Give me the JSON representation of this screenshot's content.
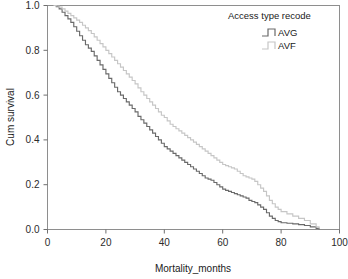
{
  "chart_data": {
    "type": "line",
    "title": "",
    "xlabel": "Mortality_months",
    "ylabel": "Cum survival",
    "xlim": [
      0,
      100
    ],
    "ylim": [
      0.0,
      1.0
    ],
    "grid": false,
    "legend_position": "top-right",
    "legend_title": "Access type recode",
    "xticks": [
      0,
      20,
      40,
      60,
      80,
      100
    ],
    "xticklabels": [
      "0",
      "20",
      "40",
      "60",
      "80",
      "100"
    ],
    "yticks": [
      0.0,
      0.2,
      0.4,
      0.6,
      0.8,
      1.0
    ],
    "yticklabels": [
      "0.0",
      "0.2",
      "0.4",
      "0.6",
      "0.8",
      "1.0"
    ],
    "series": [
      {
        "name": "AVG",
        "color": "#6a6a6a",
        "x": [
          2,
          3,
          4,
          5,
          6,
          7,
          8,
          9,
          10,
          11,
          12,
          13,
          14,
          15,
          16,
          17,
          18,
          19,
          20,
          21,
          22,
          23,
          24,
          25,
          26,
          27,
          28,
          29,
          30,
          31,
          32,
          33,
          34,
          35,
          36,
          37,
          38,
          39,
          40,
          41,
          42,
          43,
          44,
          45,
          46,
          47,
          48,
          49,
          50,
          51,
          52,
          53,
          54,
          55,
          56,
          57,
          58,
          59,
          60,
          61,
          62,
          63,
          64,
          65,
          66,
          67,
          68,
          69,
          70,
          71,
          72,
          73,
          74,
          75,
          76,
          77,
          78,
          79,
          80,
          82,
          84,
          86,
          88,
          90,
          92,
          93
        ],
        "values": [
          1.0,
          0.995,
          0.985,
          0.97,
          0.955,
          0.94,
          0.925,
          0.905,
          0.885,
          0.865,
          0.845,
          0.825,
          0.81,
          0.795,
          0.775,
          0.755,
          0.735,
          0.715,
          0.695,
          0.675,
          0.655,
          0.635,
          0.615,
          0.6,
          0.585,
          0.57,
          0.555,
          0.54,
          0.525,
          0.505,
          0.49,
          0.475,
          0.46,
          0.445,
          0.43,
          0.415,
          0.4,
          0.385,
          0.37,
          0.36,
          0.35,
          0.34,
          0.33,
          0.32,
          0.31,
          0.3,
          0.29,
          0.28,
          0.27,
          0.26,
          0.25,
          0.24,
          0.23,
          0.225,
          0.22,
          0.21,
          0.2,
          0.19,
          0.18,
          0.175,
          0.17,
          0.165,
          0.16,
          0.155,
          0.15,
          0.145,
          0.14,
          0.13,
          0.125,
          0.12,
          0.11,
          0.1,
          0.09,
          0.075,
          0.06,
          0.05,
          0.04,
          0.035,
          0.03,
          0.028,
          0.025,
          0.022,
          0.018,
          0.012,
          0.005,
          0.0
        ]
      },
      {
        "name": "AVF",
        "color": "#c6c6c6",
        "x": [
          2,
          3,
          4,
          5,
          6,
          7,
          8,
          9,
          10,
          11,
          12,
          13,
          14,
          15,
          16,
          17,
          18,
          19,
          20,
          21,
          22,
          23,
          24,
          25,
          26,
          27,
          28,
          29,
          30,
          31,
          32,
          33,
          34,
          35,
          36,
          37,
          38,
          39,
          40,
          41,
          42,
          43,
          44,
          45,
          46,
          47,
          48,
          49,
          50,
          51,
          52,
          53,
          54,
          55,
          56,
          57,
          58,
          59,
          60,
          61,
          62,
          63,
          64,
          65,
          66,
          67,
          68,
          69,
          70,
          71,
          72,
          73,
          74,
          75,
          76,
          77,
          78,
          79,
          80,
          82,
          84,
          86,
          88,
          90,
          92,
          93
        ],
        "values": [
          1.0,
          0.998,
          0.993,
          0.985,
          0.975,
          0.965,
          0.955,
          0.945,
          0.935,
          0.925,
          0.912,
          0.9,
          0.888,
          0.875,
          0.86,
          0.845,
          0.83,
          0.815,
          0.8,
          0.785,
          0.77,
          0.755,
          0.74,
          0.725,
          0.71,
          0.695,
          0.68,
          0.665,
          0.65,
          0.632,
          0.615,
          0.6,
          0.585,
          0.57,
          0.555,
          0.54,
          0.525,
          0.51,
          0.5,
          0.485,
          0.47,
          0.46,
          0.45,
          0.44,
          0.43,
          0.42,
          0.41,
          0.4,
          0.39,
          0.38,
          0.37,
          0.36,
          0.35,
          0.34,
          0.33,
          0.32,
          0.31,
          0.3,
          0.29,
          0.285,
          0.28,
          0.275,
          0.27,
          0.26,
          0.25,
          0.24,
          0.235,
          0.23,
          0.225,
          0.215,
          0.2,
          0.185,
          0.17,
          0.15,
          0.13,
          0.115,
          0.1,
          0.09,
          0.08,
          0.07,
          0.06,
          0.05,
          0.04,
          0.025,
          0.012,
          0.004
        ]
      }
    ]
  },
  "axes": {
    "x_title": "Mortality_months",
    "y_title": "Cum survival"
  },
  "legend": {
    "title": "Access type recode",
    "items": [
      {
        "label": "AVG",
        "color": "#6a6a6a"
      },
      {
        "label": "AVF",
        "color": "#c6c6c6"
      }
    ]
  }
}
